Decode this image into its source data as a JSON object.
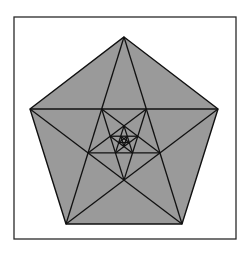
{
  "figure": {
    "colors": {
      "background": "#ffffff",
      "frame": "#2a2a2a",
      "fill": "#9a9a9a",
      "stroke": "#111111"
    },
    "frame": {
      "x": 14,
      "y": 17,
      "width": 222,
      "height": 222
    },
    "outer_pentagon": [
      [
        124,
        37
      ],
      [
        218,
        109
      ],
      [
        182,
        224
      ],
      [
        66,
        224
      ],
      [
        30,
        109
      ]
    ],
    "levels": 4
  }
}
